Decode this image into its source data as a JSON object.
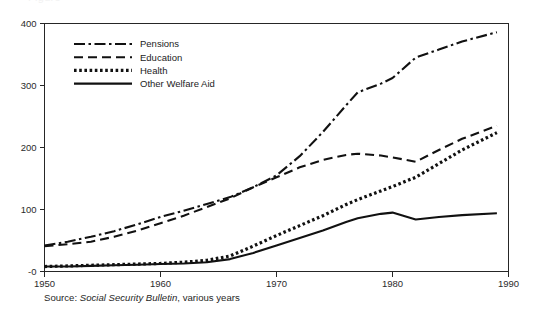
{
  "figure": {
    "clipped_caption_top": "Figure",
    "source": {
      "label": "Source:",
      "publication": "Social Security Bulletin",
      "tail": ", various years"
    }
  },
  "chart_data": {
    "type": "line",
    "title": "",
    "subtitle": "",
    "xlabel": "",
    "ylabel": "",
    "xlim": [
      1950,
      1990
    ],
    "ylim": [
      0,
      400
    ],
    "grid": false,
    "legend_position": "top-left",
    "x_ticks": [
      "1950",
      "1960",
      "1970",
      "1980",
      "1990"
    ],
    "x_tick_values": [
      1950,
      1960,
      1970,
      1980,
      1990
    ],
    "y_ticks": [
      "-0",
      "100",
      "200",
      "300",
      "400"
    ],
    "y_tick_values": [
      0,
      100,
      200,
      300,
      400
    ],
    "series": [
      {
        "name": "Pensions",
        "style": "dash-dot",
        "dasharray": "11,3.5,2.5,3.5",
        "width": 2.1,
        "x": [
          1950,
          1952,
          1954,
          1956,
          1958,
          1960,
          1962,
          1964,
          1966,
          1968,
          1970,
          1972,
          1974,
          1976,
          1977,
          1979,
          1980,
          1982,
          1984,
          1986,
          1989
        ],
        "values": [
          42,
          48,
          56,
          65,
          76,
          88,
          98,
          109,
          120,
          136,
          155,
          186,
          225,
          268,
          289,
          303,
          312,
          345,
          358,
          371,
          386
        ]
      },
      {
        "name": "Education",
        "style": "dashed",
        "dasharray": "9,5",
        "width": 2.1,
        "x": [
          1950,
          1952,
          1954,
          1956,
          1958,
          1960,
          1962,
          1964,
          1966,
          1968,
          1970,
          1972,
          1974,
          1976,
          1977,
          1979,
          1980,
          1982,
          1984,
          1986,
          1989
        ],
        "values": [
          41,
          44,
          48,
          56,
          66,
          78,
          90,
          104,
          118,
          136,
          152,
          168,
          180,
          188,
          190,
          187,
          184,
          177,
          196,
          214,
          235
        ]
      },
      {
        "name": "Health",
        "style": "dotted",
        "dasharray": "2.6,2.6",
        "width": 3.2,
        "x": [
          1950,
          1952,
          1954,
          1956,
          1958,
          1960,
          1962,
          1964,
          1966,
          1968,
          1970,
          1972,
          1974,
          1976,
          1977,
          1979,
          1980,
          1982,
          1984,
          1986,
          1989
        ],
        "values": [
          8,
          9,
          10,
          11,
          12,
          13,
          15,
          18,
          25,
          41,
          58,
          74,
          90,
          108,
          116,
          130,
          137,
          152,
          174,
          196,
          224
        ]
      },
      {
        "name": "Other Welfare Aid",
        "style": "solid",
        "dasharray": "",
        "width": 2.1,
        "x": [
          1950,
          1952,
          1954,
          1956,
          1958,
          1960,
          1962,
          1964,
          1966,
          1968,
          1970,
          1972,
          1974,
          1976,
          1977,
          1979,
          1980,
          1982,
          1984,
          1986,
          1989
        ],
        "values": [
          8,
          8,
          9,
          10,
          11,
          12,
          13,
          15,
          20,
          30,
          42,
          54,
          66,
          80,
          86,
          93,
          95,
          84,
          88,
          91,
          94
        ]
      }
    ],
    "legend_entries": [
      {
        "label": "Pensions"
      },
      {
        "label": "Education"
      },
      {
        "label": "Health"
      },
      {
        "label": "Other Welfare Aid"
      }
    ],
    "colors": {
      "line": "#111111",
      "axis": "#262626",
      "text": "#1c1c1c",
      "background": "#ffffff"
    }
  }
}
